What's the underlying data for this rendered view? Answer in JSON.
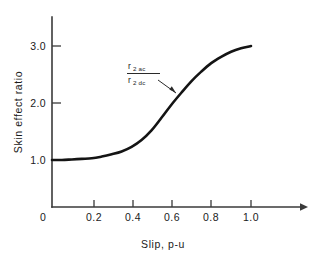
{
  "chart_data": {
    "type": "line",
    "title": "",
    "xlabel": "Slip, p-u",
    "ylabel": "Skin effect ratio",
    "xlim": [
      0,
      1.1
    ],
    "ylim": [
      0,
      3.35
    ],
    "grid": false,
    "legend": "none",
    "x_ticks": [
      "0",
      "0.2",
      "0.4",
      "0.6",
      "0.8",
      "1.0"
    ],
    "x_tick_values": [
      0,
      0.2,
      0.4,
      0.6,
      0.8,
      1.0
    ],
    "y_ticks": [
      "1.0",
      "2.0",
      "3.0"
    ],
    "y_tick_values": [
      1.0,
      2.0,
      3.0
    ],
    "series": [
      {
        "name": "r2ac/r2dc",
        "x": [
          0.0,
          0.05,
          0.1,
          0.15,
          0.2,
          0.25,
          0.3,
          0.35,
          0.4,
          0.45,
          0.5,
          0.55,
          0.6,
          0.65,
          0.7,
          0.75,
          0.8,
          0.85,
          0.9,
          0.95,
          1.0
        ],
        "values": [
          1.0,
          1.0,
          1.01,
          1.02,
          1.03,
          1.06,
          1.1,
          1.15,
          1.23,
          1.35,
          1.52,
          1.74,
          1.97,
          2.18,
          2.38,
          2.55,
          2.7,
          2.81,
          2.9,
          2.96,
          3.0
        ]
      }
    ],
    "annotations": [
      {
        "name": "resistance-ratio-label",
        "numerator": "r",
        "numerator_sub": "2 ac",
        "denominator": "r",
        "denominator_sub": "2 dc",
        "points_to_x": 0.63,
        "points_to_y": 2.12
      }
    ]
  },
  "axes": {
    "x_title": "Slip, p-u",
    "y_title": "Skin effect ratio",
    "origin_label": "0"
  },
  "colors": {
    "curve": "#141414",
    "axis": "#3a3a3a",
    "text": "#1a1a1a",
    "background": "#ffffff"
  }
}
